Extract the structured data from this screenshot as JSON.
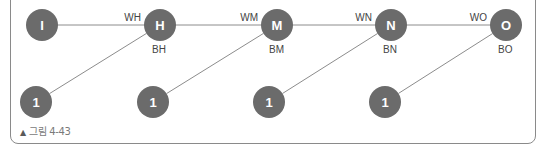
{
  "figure": {
    "caption_marker": "▲",
    "caption": "그림 4-43"
  },
  "colors": {
    "node_fill": "#6b6b6b",
    "node_text": "#ffffff",
    "edge": "#8c8c8c",
    "label": "#444444"
  },
  "nodes": {
    "top": [
      {
        "id": "I",
        "label": "I"
      },
      {
        "id": "H",
        "label": "H"
      },
      {
        "id": "M",
        "label": "M"
      },
      {
        "id": "N",
        "label": "N"
      },
      {
        "id": "O",
        "label": "O"
      }
    ],
    "bottom": [
      {
        "id": "bias_H",
        "label": "1"
      },
      {
        "id": "bias_M",
        "label": "1"
      },
      {
        "id": "bias_N",
        "label": "1"
      },
      {
        "id": "bias_O",
        "label": "1"
      }
    ]
  },
  "edges": {
    "weights": [
      {
        "from": "I",
        "to": "H",
        "label": "WH"
      },
      {
        "from": "H",
        "to": "M",
        "label": "WM"
      },
      {
        "from": "M",
        "to": "N",
        "label": "WN"
      },
      {
        "from": "N",
        "to": "O",
        "label": "WO"
      }
    ],
    "biases": [
      {
        "from": "bias_H",
        "to": "H",
        "label": "BH"
      },
      {
        "from": "bias_M",
        "to": "M",
        "label": "BM"
      },
      {
        "from": "bias_N",
        "to": "N",
        "label": "BN"
      },
      {
        "from": "bias_O",
        "to": "O",
        "label": "BO"
      }
    ]
  }
}
